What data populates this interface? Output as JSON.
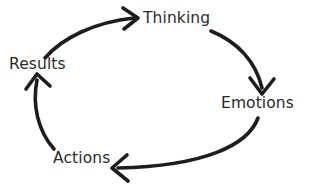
{
  "diagram": {
    "type": "cycle-diagram",
    "direction": "clockwise",
    "background_color": "#ffffff",
    "stroke_color": "#1d1d1d",
    "text_color": "#2b2b2b",
    "nodes": [
      {
        "id": "thinking",
        "label": "Thinking",
        "x": 143,
        "y": 11
      },
      {
        "id": "emotions",
        "label": "Emotions",
        "x": 221,
        "y": 96
      },
      {
        "id": "actions",
        "label": "Actions",
        "x": 53,
        "y": 151
      },
      {
        "id": "results",
        "label": "Results",
        "x": 9,
        "y": 57
      }
    ],
    "arrows": [
      {
        "id": "results-to-thinking",
        "from": "results",
        "to": "thinking",
        "head_direction": "right"
      },
      {
        "id": "thinking-to-emotions",
        "from": "thinking",
        "to": "emotions",
        "head_direction": "down"
      },
      {
        "id": "emotions-to-actions",
        "from": "emotions",
        "to": "actions",
        "head_direction": "left"
      },
      {
        "id": "actions-to-results",
        "from": "actions",
        "to": "results",
        "head_direction": "up"
      }
    ]
  }
}
